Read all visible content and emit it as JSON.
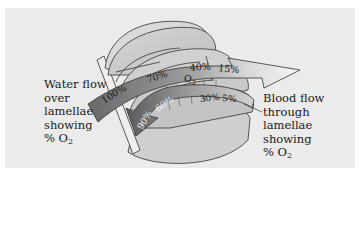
{
  "figure": {
    "topic": "Countercurrent exchange in fish gill lamellae",
    "water_label": {
      "lines": [
        "Water flow",
        "over",
        "lamellae",
        "showing"
      ],
      "last_line_prefix": "% O",
      "last_line_sub": "2"
    },
    "blood_label": {
      "lines": [
        "Blood flow",
        "through",
        "lamellae",
        "showing"
      ],
      "last_line_prefix": "% O",
      "last_line_sub": "2"
    },
    "water_arrow": {
      "direction": "left-to-right",
      "values": [
        "100%",
        "70%",
        "40%",
        "15%"
      ],
      "o2_label_prefix": "O",
      "o2_label_sub": "2"
    },
    "blood_arrow": {
      "direction": "right-to-left",
      "values": [
        "90%",
        "60%",
        "30%",
        "5%"
      ]
    },
    "colors": {
      "panel_bg": "#ebebeb",
      "lamella_fill": "#c9c9c9",
      "lamella_light": "#dcdcdc",
      "outline": "#333333",
      "water_dark": "#6e6e6e",
      "water_light": "#f2f2f2",
      "blood_dark": "#5f5f5f",
      "blood_light": "#c8c8c8"
    }
  }
}
